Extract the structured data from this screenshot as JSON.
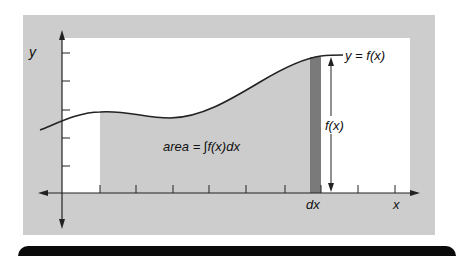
{
  "diagram": {
    "curve_label": "y = f(x)",
    "area_label": "area = ∫f(x)dx",
    "height_label": "f(x)",
    "strip_label": "dx",
    "x_axis_label": "x",
    "y_axis_label": "y"
  },
  "colors": {
    "panel_bg": "#cdcdcd",
    "plot_bg": "#ffffff",
    "area_fill": "#cccccc",
    "strip_fill": "#7a7a7a",
    "curve": "#222222",
    "bottom_bar": "#0a0a0a"
  }
}
